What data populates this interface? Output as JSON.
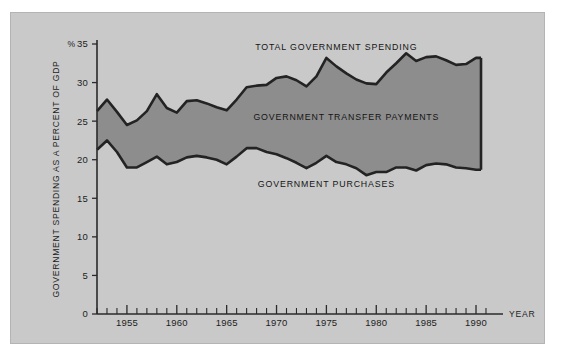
{
  "figure": {
    "background_color": "#ffffff",
    "panel_color": "#c9c9c9",
    "band_fill_color": "#8d8d8d",
    "line_color": "#232323"
  },
  "axes": {
    "y_caption": "GOVERNMENT SPENDING AS A PERCENT OF GDP",
    "y_unit_symbol": "%",
    "x_caption": "YEAR",
    "y_ticks": [
      0,
      5,
      10,
      15,
      20,
      25,
      30,
      35
    ],
    "x_ticks_labeled": [
      1955,
      1960,
      1965,
      1970,
      1975,
      1980,
      1985,
      1990
    ]
  },
  "labels": {
    "total": "TOTAL GOVERNMENT SPENDING",
    "transfers": "GOVERNMENT TRANSFER PAYMENTS",
    "purchases": "GOVERNMENT PURCHASES"
  },
  "chart_data": {
    "type": "area",
    "title": "",
    "subtitle": "",
    "xlabel": "YEAR",
    "ylabel": "GOVERNMENT SPENDING AS A PERCENT OF GDP",
    "yunit": "%",
    "xlim": [
      1952,
      1990.5
    ],
    "ylim": [
      0,
      35
    ],
    "grid": false,
    "legend_position": "inline-annotations",
    "annotations": [
      {
        "text": "TOTAL GOVERNMENT SPENDING",
        "x": 1976,
        "y": 34.2
      },
      {
        "text": "GOVERNMENT TRANSFER PAYMENTS",
        "x": 1977,
        "y": 25.2
      },
      {
        "text": "GOVERNMENT PURCHASES",
        "x": 1975,
        "y": 16.5
      }
    ],
    "x": [
      1952,
      1953,
      1954,
      1955,
      1956,
      1957,
      1958,
      1959,
      1960,
      1961,
      1962,
      1963,
      1964,
      1965,
      1966,
      1967,
      1968,
      1969,
      1970,
      1971,
      1972,
      1973,
      1974,
      1975,
      1976,
      1977,
      1978,
      1979,
      1980,
      1981,
      1982,
      1983,
      1984,
      1985,
      1986,
      1987,
      1988,
      1989,
      1990,
      1990.5
    ],
    "series": [
      {
        "name": "TOTAL GOVERNMENT SPENDING",
        "values": [
          26.3,
          27.8,
          26.2,
          24.5,
          25.1,
          26.3,
          28.5,
          26.7,
          26.1,
          27.6,
          27.7,
          27.3,
          26.8,
          26.4,
          27.8,
          29.4,
          29.6,
          29.7,
          30.6,
          30.8,
          30.3,
          29.5,
          30.8,
          33.2,
          32.1,
          31.2,
          30.4,
          29.9,
          29.8,
          31.3,
          32.5,
          33.8,
          32.8,
          33.3,
          33.4,
          32.9,
          32.3,
          32.4,
          33.2,
          33.2
        ]
      },
      {
        "name": "GOVERNMENT PURCHASES",
        "values": [
          21.3,
          22.5,
          21.0,
          19.0,
          19.0,
          19.7,
          20.4,
          19.4,
          19.7,
          20.3,
          20.5,
          20.3,
          20.0,
          19.4,
          20.4,
          21.5,
          21.5,
          21.0,
          20.7,
          20.2,
          19.6,
          18.9,
          19.6,
          20.5,
          19.7,
          19.4,
          18.9,
          18.0,
          18.4,
          18.4,
          19.0,
          19.0,
          18.6,
          19.3,
          19.5,
          19.4,
          19.0,
          18.9,
          18.7,
          18.7
        ]
      }
    ],
    "derived_series": [
      {
        "name": "GOVERNMENT TRANSFER PAYMENTS",
        "description": "Vertical distance between total government spending and government purchases",
        "values": [
          5.0,
          5.3,
          5.2,
          5.5,
          6.1,
          6.6,
          8.1,
          7.3,
          6.4,
          7.3,
          7.2,
          7.0,
          6.8,
          7.0,
          7.4,
          7.9,
          8.1,
          8.7,
          9.9,
          10.6,
          10.7,
          10.6,
          11.2,
          12.7,
          12.4,
          11.8,
          11.5,
          11.9,
          11.4,
          12.9,
          13.5,
          14.8,
          14.2,
          14.0,
          13.9,
          13.5,
          13.3,
          13.5,
          14.5,
          14.5
        ]
      }
    ]
  }
}
